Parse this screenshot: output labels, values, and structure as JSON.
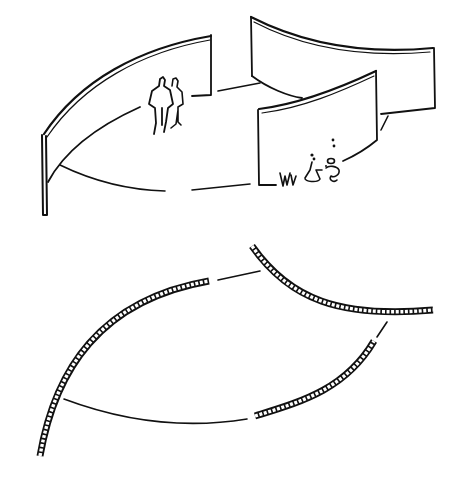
{
  "colors": {
    "ink": "#111111",
    "paper": "#ffffff"
  },
  "perspective_sketch": {
    "walls": [
      {
        "name": "left-curved-wall",
        "top": "M46,136 C90,80 150,45 211,35",
        "bottom": "M48,180 C80,140 130,115 140,108",
        "edge_left": "M44,136 L44,215",
        "edge_right": "M211,35 L211,95"
      },
      {
        "name": "right-upper-wall",
        "top": "M252,18 C300,40 360,55 433,48",
        "bottom": "M255,78 C270,90 290,97 302,98",
        "edge_left": "M252,18 L252,78",
        "edge_right": "M433,48 L434,108"
      },
      {
        "name": "right-lower-wall",
        "top": "M259,110 C300,105 340,90 376,72",
        "bottom": "M376,140 C365,150 350,158 342,162",
        "edge_left": "M259,110 L260,185",
        "edge_right": "M376,72 L376,140"
      }
    ],
    "ground_paths": [
      "M60,165 C90,180 130,190 165,192",
      "M192,190 L250,184 L260,185",
      "M218,92 L260,84",
      "M192,96 L210,95",
      "M260,185 L278,185",
      "M385,116 L380,130",
      "M378,111 L430,110"
    ]
  },
  "plan_sketch": {
    "walls": [
      {
        "name": "plan-wall-left",
        "path": "M40,455 C60,360 110,300 210,282"
      },
      {
        "name": "plan-wall-upper-right",
        "path": "M252,245 C290,300 340,315 433,310"
      },
      {
        "name": "plan-wall-lower-right",
        "path": "M255,416 C300,400 340,390 374,340"
      }
    ],
    "thin_lines": [
      "M218,280 L260,271",
      "M64,398 C130,420 200,430 247,419",
      "M388,322 L377,337"
    ]
  }
}
